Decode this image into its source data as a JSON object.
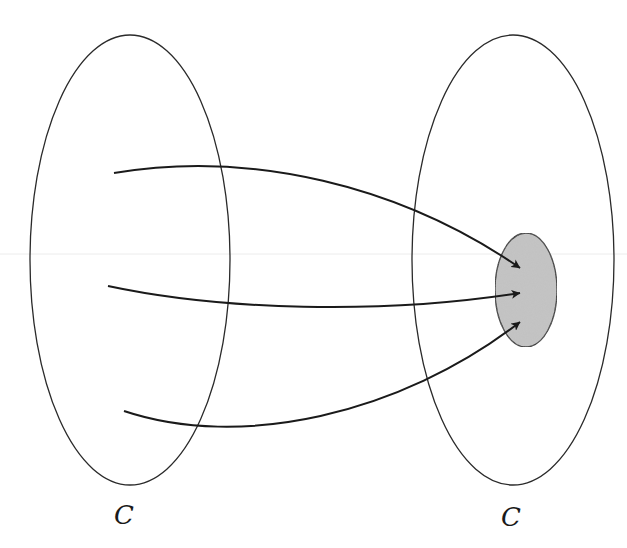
{
  "diagram": {
    "type": "mapping",
    "colors": {
      "stroke": "#2a2a2a",
      "arrow": "#1a1a1a",
      "subset_fill": "#c4c4c4",
      "background": "#ffffff",
      "scanline": "#ececec"
    },
    "sets": [
      {
        "id": "domain",
        "label": "C",
        "cx": 130,
        "cy": 260,
        "rx": 100,
        "ry": 225,
        "label_x": 114,
        "label_y": 502
      },
      {
        "id": "codomain",
        "label": "C",
        "cx": 513,
        "cy": 260,
        "rx": 101,
        "ry": 225,
        "label_x": 501,
        "label_y": 504
      }
    ],
    "subset": {
      "id": "image",
      "cx": 526,
      "cy": 290,
      "rx": 31,
      "ry": 57,
      "shaded": true
    },
    "arrows": [
      {
        "id": "arrow-top",
        "path": "M114,173 C250,150 400,185 520,268"
      },
      {
        "id": "arrow-middle",
        "path": "M108,286 C220,310 380,315 520,293"
      },
      {
        "id": "arrow-bottom",
        "path": "M124,411 C240,450 400,415 520,322"
      }
    ]
  }
}
